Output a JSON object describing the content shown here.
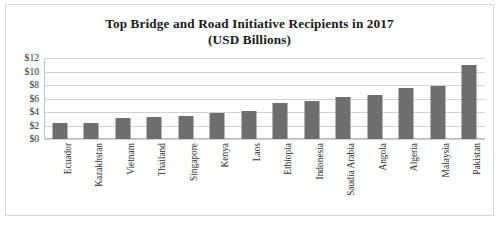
{
  "chart_data": {
    "type": "bar",
    "title": "Top Bridge and Road Initiative Recipients in 2017",
    "subtitle": "(USD Billions)",
    "xlabel": "",
    "ylabel": "",
    "ylim": [
      0,
      12
    ],
    "ytick_labels": [
      "$12",
      "$10",
      "$8",
      "$6",
      "$4",
      "$2",
      "$0"
    ],
    "ytick_values": [
      12,
      10,
      8,
      6,
      4,
      2,
      0
    ],
    "grid": true,
    "legend": "none",
    "bar_color": "#6e6e6e",
    "gridline_color": "#d2d2d2",
    "categories": [
      "Ecuador",
      "Kazakhstan",
      "Vietnam",
      "Thailand",
      "Singapore",
      "Kenya",
      "Laos",
      "Ethiopia",
      "Indonesia",
      "Saudia Arabia",
      "Angola",
      "Algeria",
      "Malaysia",
      "Pakistan"
    ],
    "values": [
      2.4,
      2.4,
      3.1,
      3.3,
      3.4,
      3.8,
      4.1,
      5.4,
      5.6,
      6.2,
      6.5,
      7.5,
      7.8,
      10.9
    ]
  }
}
